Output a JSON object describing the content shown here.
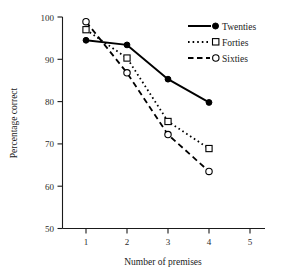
{
  "chart_data": {
    "type": "line",
    "title": "",
    "xlabel": "Number of premises",
    "ylabel": "Percentage correct",
    "xlim": [
      0.5,
      5.4
    ],
    "ylim": [
      50,
      100
    ],
    "xticks": [
      1,
      2,
      3,
      4,
      5
    ],
    "yticks": [
      50,
      60,
      70,
      80,
      90,
      100
    ],
    "xtick_labels": [
      "1",
      "2",
      "3",
      "4",
      "5"
    ],
    "ytick_labels": [
      "50",
      "60",
      "70",
      "80",
      "90",
      "100"
    ],
    "grid": false,
    "legend_position": "top-right",
    "x": [
      1,
      2,
      3,
      4
    ],
    "series": [
      {
        "name": "Twenties",
        "values": [
          94.5,
          93.4,
          85.3,
          79.8
        ],
        "line_style": "solid",
        "marker": "filled-circle",
        "color": "#000000"
      },
      {
        "name": "Forties",
        "values": [
          97.0,
          90.3,
          75.3,
          68.9
        ],
        "line_style": "dotted",
        "marker": "open-square",
        "color": "#000000"
      },
      {
        "name": "Sixties",
        "values": [
          98.9,
          86.8,
          72.2,
          63.5
        ],
        "line_style": "dashed",
        "marker": "open-circle",
        "color": "#000000"
      }
    ]
  },
  "axes": {
    "y_title": "Percentage correct",
    "x_title": "Number of premises"
  },
  "legend": {
    "entries": [
      {
        "label": "Twenties",
        "style": "solid",
        "marker": "filled-circle"
      },
      {
        "label": "Forties",
        "style": "dotted",
        "marker": "open-square"
      },
      {
        "label": "Sixties",
        "style": "dashed",
        "marker": "open-circle"
      }
    ]
  },
  "ticks": {
    "y": [
      "100",
      "90",
      "80",
      "70",
      "60",
      "50"
    ],
    "x": [
      "1",
      "2",
      "3",
      "4",
      "5"
    ]
  }
}
